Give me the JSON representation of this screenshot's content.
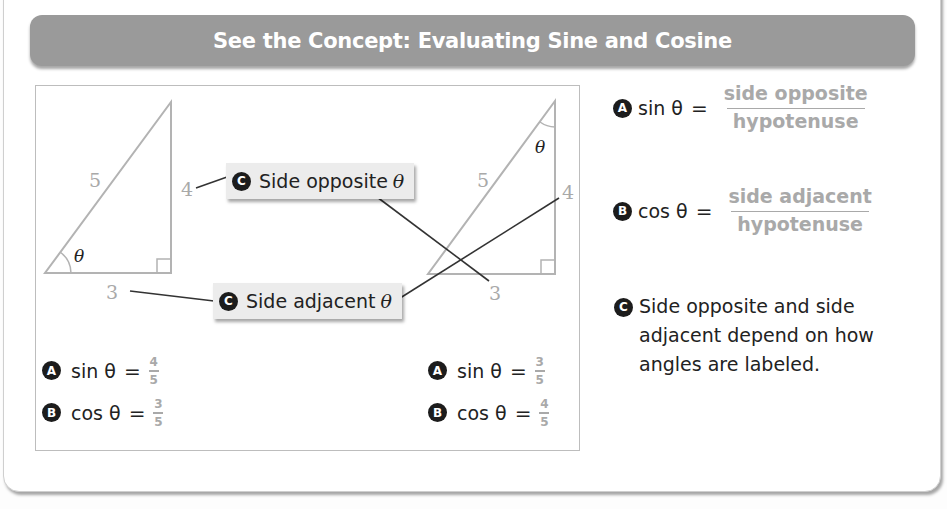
{
  "header": {
    "title": "See the Concept: Evaluating Sine and Cosine"
  },
  "colors": {
    "header_bg": "#9a9a9a",
    "label_gray": "#a9a9a9",
    "line_dark": "#333333",
    "badge": "#1c1c1c"
  },
  "left_triangle": {
    "hypotenuse": "5",
    "opposite": "4",
    "adjacent": "3",
    "angle": "θ",
    "equations": [
      {
        "badge": "A",
        "fn": "sin θ",
        "eq": "=",
        "num": "4",
        "den": "5"
      },
      {
        "badge": "B",
        "fn": "cos θ",
        "eq": "=",
        "num": "3",
        "den": "5"
      }
    ]
  },
  "right_triangle": {
    "hypotenuse": "5",
    "vertical_side": "4",
    "base": "3",
    "angle": "θ",
    "equations": [
      {
        "badge": "A",
        "fn": "sin θ",
        "eq": "=",
        "num": "3",
        "den": "5"
      },
      {
        "badge": "B",
        "fn": "cos θ",
        "eq": "=",
        "num": "4",
        "den": "5"
      }
    ]
  },
  "callouts": [
    {
      "badge": "C",
      "label": "Side opposite",
      "symbol": "θ"
    },
    {
      "badge": "C",
      "label": "Side adjacent",
      "symbol": "θ"
    }
  ],
  "definitions": [
    {
      "badge": "A",
      "fn": "sin θ",
      "eq": "=",
      "num": "side opposite",
      "den": "hypotenuse"
    },
    {
      "badge": "B",
      "fn": "cos θ",
      "eq": "=",
      "num": "side adjacent",
      "den": "hypotenuse"
    }
  ],
  "note": {
    "badge": "C",
    "text": "Side opposite and side adjacent depend on how angles are labeled."
  }
}
